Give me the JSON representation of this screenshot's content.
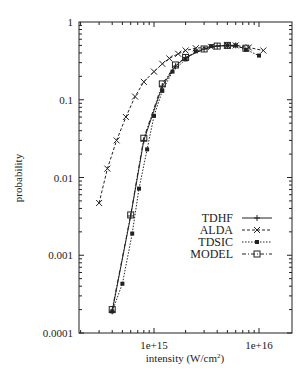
{
  "chart_data": {
    "type": "line",
    "title": "",
    "xlabel": "intensity (W/cm²)",
    "ylabel": "probability",
    "xscale": "log",
    "yscale": "log",
    "xlim": [
      240000000000000.0,
      1.3e+16
    ],
    "ylim": [
      0.0001,
      1
    ],
    "x_tick_labels": [
      "1e+15",
      "1e+16"
    ],
    "y_tick_labels": [
      "1",
      "0.1",
      "0.01",
      "0.001",
      "0.0001"
    ],
    "grid": false,
    "legend_position": "center-right",
    "series": [
      {
        "name": "TDHF",
        "style": "solid",
        "marker": "plus",
        "points": [
          [
            400000000000000.0,
            0.00019
          ],
          [
            600000000000000.0,
            0.0032
          ],
          [
            800000000000000.0,
            0.03
          ],
          [
            1200000000000000.0,
            0.15
          ],
          [
            1600000000000000.0,
            0.27
          ],
          [
            2000000000000000.0,
            0.35
          ],
          [
            3000000000000000.0,
            0.45
          ],
          [
            4000000000000000.0,
            0.49
          ],
          [
            5000000000000000.0,
            0.5
          ],
          [
            6000000000000000.0,
            0.5
          ]
        ]
      },
      {
        "name": "ALDA",
        "style": "dashed",
        "marker": "x",
        "points": [
          [
            300000000000000.0,
            0.0047
          ],
          [
            360000000000000.0,
            0.013
          ],
          [
            440000000000000.0,
            0.03
          ],
          [
            540000000000000.0,
            0.06
          ],
          [
            660000000000000.0,
            0.11
          ],
          [
            800000000000000.0,
            0.17
          ],
          [
            1000000000000000.0,
            0.23
          ],
          [
            1200000000000000.0,
            0.29
          ],
          [
            1400000000000000.0,
            0.34
          ],
          [
            1700000000000000.0,
            0.39
          ],
          [
            2000000000000000.0,
            0.43
          ],
          [
            2500000000000000.0,
            0.46
          ],
          [
            3500000000000000.0,
            0.48
          ],
          [
            5000000000000000.0,
            0.5
          ],
          [
            6000000000000000.0,
            0.5
          ],
          [
            8000000000000000.0,
            0.47
          ],
          [
            1.1e+16,
            0.43
          ]
        ]
      },
      {
        "name": "TDSIC",
        "style": "dotted",
        "marker": "filled-square",
        "points": [
          [
            400000000000000.0,
            0.00019
          ],
          [
            500000000000000.0,
            0.00043
          ],
          [
            620000000000000.0,
            0.0019
          ],
          [
            720000000000000.0,
            0.0072
          ],
          [
            860000000000000.0,
            0.023
          ],
          [
            1000000000000000.0,
            0.062
          ],
          [
            1200000000000000.0,
            0.13
          ],
          [
            1500000000000000.0,
            0.23
          ],
          [
            2000000000000000.0,
            0.33
          ],
          [
            2500000000000000.0,
            0.42
          ],
          [
            3500000000000000.0,
            0.49
          ],
          [
            5000000000000000.0,
            0.5
          ],
          [
            6000000000000000.0,
            0.5
          ],
          [
            7500000000000000.0,
            0.44
          ],
          [
            1e+16,
            0.37
          ]
        ]
      },
      {
        "name": "MODEL",
        "style": "dash-dot",
        "marker": "open-square",
        "points": [
          [
            400000000000000.0,
            0.0002
          ],
          [
            600000000000000.0,
            0.0033
          ],
          [
            800000000000000.0,
            0.032
          ],
          [
            1200000000000000.0,
            0.16
          ],
          [
            1600000000000000.0,
            0.28
          ],
          [
            2000000000000000.0,
            0.35
          ],
          [
            3000000000000000.0,
            0.45
          ],
          [
            4000000000000000.0,
            0.49
          ],
          [
            5000000000000000.0,
            0.5
          ],
          [
            7500000000000000.0,
            0.46
          ]
        ]
      }
    ]
  },
  "axes": {
    "xlabel_main": "intensity (W/cm",
    "xlabel_sup": "2",
    "xlabel_end": ")",
    "ylabel": "probability"
  },
  "legend": [
    "TDHF",
    "ALDA",
    "TDSIC",
    "MODEL"
  ]
}
